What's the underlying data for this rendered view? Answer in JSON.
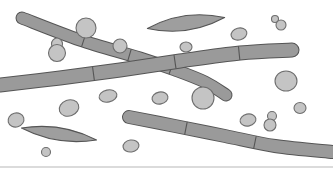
{
  "figure": {
    "caption": "",
    "width": 333,
    "height": 171,
    "background_color": "#ffffff"
  },
  "palette": {
    "filament_fill": "#9a9a9a",
    "filament_stroke": "#555555",
    "spore_fill": "#c4c4c4",
    "spore_stroke": "#6e6e6e",
    "spindle_fill": "#9e9e9e",
    "baseline_color": "#cfcfcf",
    "background": "#ffffff"
  },
  "structures": {
    "hyphae": [
      {
        "name": "diagonal-hypha-upper-left",
        "label": "pseudohypha descending from upper left through crossing point",
        "stroke_width": 11,
        "points": "22,18 80,40 140,58 175,70 205,82 226,95",
        "rounded_start": false,
        "rounded_end": true,
        "septa": [
          {
            "t": 0.3
          },
          {
            "t": 0.52
          },
          {
            "t": 0.72
          }
        ]
      },
      {
        "name": "main-horizontal-hypha",
        "label": "long septate hypha running left edge to right, slightly rising",
        "stroke_width": 13,
        "points": "0,85 60,78 120,70 180,61 240,53 292,50",
        "rounded_start": false,
        "rounded_end": true,
        "septa": [
          {
            "t": 0.32
          },
          {
            "t": 0.6
          },
          {
            "t": 0.82
          }
        ]
      },
      {
        "name": "bottom-curved-hypha",
        "label": "curved hypha from mid-left descending to right edge",
        "stroke_width": 12,
        "points": "129,117 175,126 225,136 275,146 333,152",
        "rounded_start": true,
        "rounded_end": false,
        "septa": [
          {
            "t": 0.28
          },
          {
            "t": 0.62
          }
        ]
      }
    ],
    "spindles": [
      {
        "name": "spindle-top-center",
        "label": "lens shaped pseudohyphal element, top center",
        "cx": 186,
        "cy": 23,
        "rx": 39,
        "ry": 7,
        "rotation": -8
      },
      {
        "name": "spindle-bottom-left",
        "label": "lens shaped pseudohyphal element, bottom left",
        "cx": 59,
        "cy": 134,
        "rx": 38,
        "ry": 6,
        "rotation": 9
      }
    ],
    "spores": [
      {
        "name": "blastospore-attached-upper-1",
        "cx": 86,
        "cy": 28,
        "rx": 10,
        "ry": 10,
        "rotation": 0
      },
      {
        "name": "blastospore-attached-upper-2",
        "cx": 120,
        "cy": 46,
        "rx": 7,
        "ry": 7,
        "rotation": 0
      },
      {
        "name": "blastospore-chain-left-small",
        "cx": 57,
        "cy": 44,
        "rx": 5.5,
        "ry": 6,
        "rotation": 0
      },
      {
        "name": "blastospore-chain-left-large",
        "cx": 57,
        "cy": 53,
        "rx": 8.5,
        "ry": 8.5,
        "rotation": 0
      },
      {
        "name": "blastospore-attached-diagonal-end",
        "cx": 203,
        "cy": 98,
        "rx": 11,
        "ry": 11,
        "rotation": 0
      },
      {
        "name": "yeast-cell-top-right-bud",
        "cx": 275,
        "cy": 19,
        "rx": 3.5,
        "ry": 3.5,
        "rotation": 0
      },
      {
        "name": "yeast-cell-top-right-mother",
        "cx": 281,
        "cy": 25,
        "rx": 5,
        "ry": 5,
        "rotation": 0
      },
      {
        "name": "yeast-cell-upper-right-oval",
        "cx": 239,
        "cy": 34,
        "rx": 8,
        "ry": 6,
        "rotation": -15
      },
      {
        "name": "yeast-cell-center-small",
        "cx": 186,
        "cy": 47,
        "rx": 6,
        "ry": 5,
        "rotation": 0
      },
      {
        "name": "yeast-cell-right-large",
        "cx": 286,
        "cy": 81,
        "rx": 11,
        "ry": 10,
        "rotation": 0
      },
      {
        "name": "yeast-cell-far-right-small",
        "cx": 300,
        "cy": 108,
        "rx": 6,
        "ry": 5.5,
        "rotation": 0
      },
      {
        "name": "yeast-cell-mid-left-oval",
        "cx": 108,
        "cy": 96,
        "rx": 9,
        "ry": 6,
        "rotation": -12
      },
      {
        "name": "yeast-cell-mid-center-oval",
        "cx": 160,
        "cy": 98,
        "rx": 8,
        "ry": 6,
        "rotation": -10
      },
      {
        "name": "yeast-cell-left-oval",
        "cx": 69,
        "cy": 108,
        "rx": 10,
        "ry": 8,
        "rotation": -20
      },
      {
        "name": "yeast-cell-lower-center-oval",
        "cx": 248,
        "cy": 120,
        "rx": 8,
        "ry": 6,
        "rotation": -12
      },
      {
        "name": "yeast-cell-lower-right-bud",
        "cx": 272,
        "cy": 116,
        "rx": 4.5,
        "ry": 4.5,
        "rotation": 0
      },
      {
        "name": "yeast-cell-lower-right-mother",
        "cx": 270,
        "cy": 125,
        "rx": 6,
        "ry": 6,
        "rotation": 0
      },
      {
        "name": "yeast-cell-bottom-left-tiny",
        "cx": 46,
        "cy": 152,
        "rx": 4.5,
        "ry": 4.5,
        "rotation": 0
      },
      {
        "name": "yeast-cell-bottom-center-oval",
        "cx": 131,
        "cy": 146,
        "rx": 8,
        "ry": 6,
        "rotation": -8
      },
      {
        "name": "yeast-cell-left-edge-oval",
        "cx": 16,
        "cy": 120,
        "rx": 8,
        "ry": 7,
        "rotation": -15
      }
    ],
    "baseline": {
      "name": "bottom-rule",
      "x1": 0,
      "y1": 167,
      "x2": 333,
      "y2": 167,
      "width": 1.6
    }
  }
}
